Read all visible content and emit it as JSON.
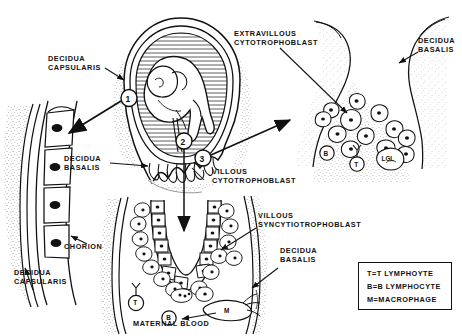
{
  "figure": {
    "width": 462,
    "height": 336,
    "ink_color": "#111111",
    "background_color": "#ffffff"
  },
  "labels": {
    "decidua_capsularis_top": "DECIDUA\nCAPSULARIS",
    "decidua_basalis_center": "DECIDUA\nBASALIS",
    "chorion": "CHORION",
    "decidua_capsularis_bottom": "DECIDUA\nCAPSULARIS",
    "extravillous_cytotrophoblast": "EXTRAVILLOUS\nCYTOTROPHOBLAST",
    "decidua_basalis_topright": "DECIDUA\nBASALIS",
    "villous_cytotrophoblast": "VILLOUS\nCYTOTROPHOBLAST",
    "villous_syncytiotrophoblast": "VILLOUS\nSYNCYTIOTROPHOBLAST",
    "decidua_basalis_bottomright": "DECIDUA\nBASALIS",
    "maternal_blood": "MATERNAL BLOOD"
  },
  "callouts": {
    "one": "1",
    "two": "2",
    "three": "3"
  },
  "cell_markers": {
    "upper_right_panel": [
      "B",
      "T",
      "LGL"
    ],
    "bottom_panel": [
      "T",
      "B",
      "M"
    ]
  },
  "legend": {
    "rows": [
      "T=T LYMPHOYTE",
      "B=B LYMPHOCYTE",
      "M=MACROPHAGE"
    ]
  },
  "panels": {
    "uterus": "uterus-with-fetus",
    "chorion_detail": "chorion-decidua-capsularis-detail",
    "decidua_basalis_detail": "extravillous-cytotrophoblast-invasion-detail",
    "villus_detail": "chorionic-villus-in-maternal-blood-detail"
  }
}
